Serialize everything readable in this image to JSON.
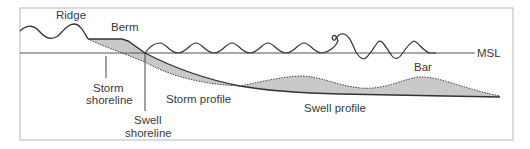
{
  "diagram": {
    "labels": {
      "ridge": "Ridge",
      "berm": "Berm",
      "msl": "MSL",
      "bar": "Bar",
      "storm_shoreline_1": "Storm",
      "storm_shoreline_2": "shoreline",
      "swell_shoreline_1": "Swell",
      "swell_shoreline_2": "shoreline",
      "storm_profile": "Storm profile",
      "swell_profile": "Swell profile"
    },
    "colors": {
      "frame": "#b8b8b8",
      "line": "#333333",
      "fill": "#c9c9c9",
      "msl_line": "#555555",
      "text": "#3a3a3a"
    }
  }
}
